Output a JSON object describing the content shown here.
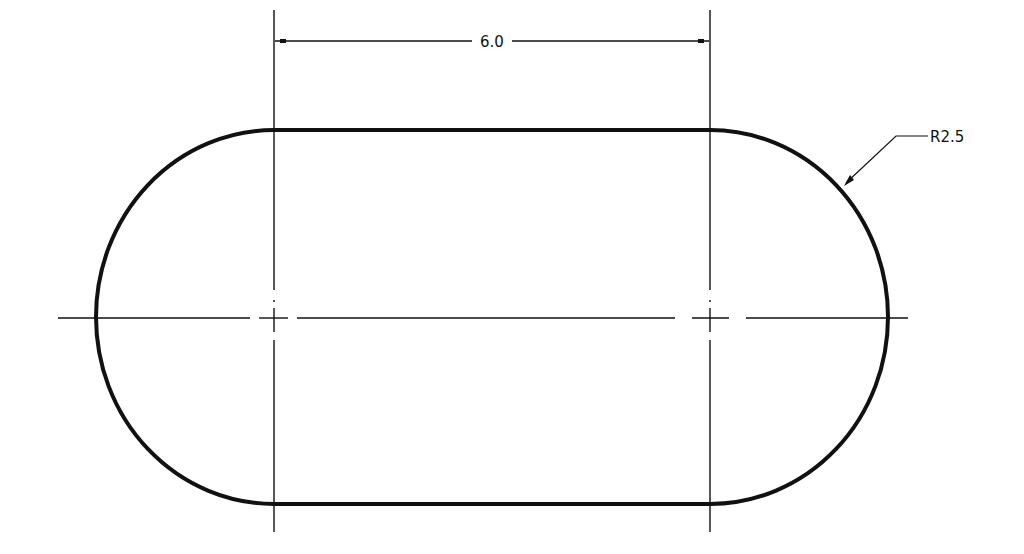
{
  "drawing": {
    "title": "Slot (obround) with dimensions",
    "dimensions": {
      "center_distance": "6.0",
      "radius": "R2.5"
    },
    "colors": {
      "background": "#ffffff",
      "outline": "#111111",
      "centerline": "#111111"
    }
  }
}
